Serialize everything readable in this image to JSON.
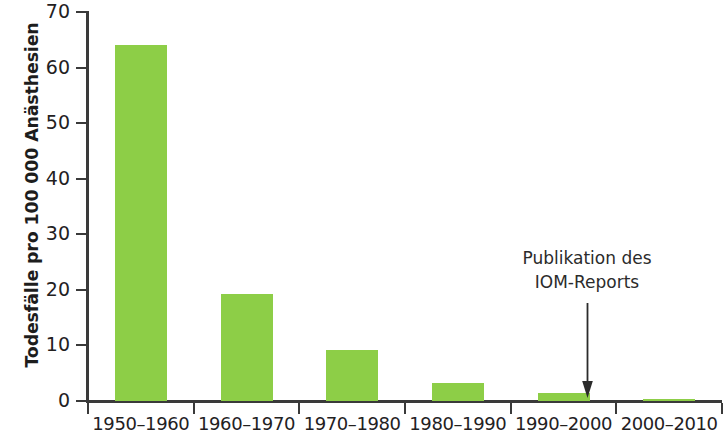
{
  "chart_data": {
    "type": "bar",
    "title": "",
    "subtitle": "",
    "xlabel": "",
    "ylabel": "Todesfälle pro 100 000 Anästhesien",
    "categories": [
      "1950–1960",
      "1960–1970",
      "1970–1980",
      "1980–1990",
      "1990–2000",
      "2000–2010"
    ],
    "values": [
      64,
      19.2,
      9.2,
      3.3,
      1.4,
      0.4
    ],
    "ylim": [
      0,
      70
    ],
    "ytick_values": [
      0,
      10,
      20,
      30,
      40,
      50,
      60,
      70
    ],
    "ytick_labels": [
      "0",
      "10",
      "20",
      "30",
      "40",
      "50",
      "60",
      "70"
    ],
    "grid": false,
    "legend": null,
    "bar_color": "#8dce47",
    "axis_color": "#3a3a3a",
    "text_color": "#23211f",
    "background_color": "#ffffff",
    "annotations": [
      {
        "lines": [
          "Publikation des",
          "IOM-Reports"
        ],
        "points_to_category": "1990–2000",
        "arrow": "down-arrow"
      }
    ]
  }
}
